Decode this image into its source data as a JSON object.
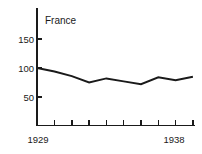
{
  "chart_data": {
    "type": "line",
    "title": "France",
    "xlabel": "",
    "ylabel": "",
    "x": [
      1929,
      1930,
      1931,
      1932,
      1933,
      1934,
      1935,
      1936,
      1937,
      1938
    ],
    "values": [
      100,
      94,
      86,
      75,
      82,
      77,
      72,
      84,
      79,
      85
    ],
    "series": [
      {
        "name": "France",
        "values": [
          100,
          94,
          86,
          75,
          82,
          77,
          72,
          84,
          79,
          85
        ]
      }
    ],
    "xlim": [
      1929,
      1938
    ],
    "ylim": [
      0,
      170
    ],
    "yticks": [
      50,
      100,
      150
    ],
    "ytick_labels": [
      "50",
      "100",
      "150"
    ],
    "xticks": [
      1929,
      1930,
      1931,
      1932,
      1933,
      1934,
      1935,
      1936,
      1937,
      1938
    ],
    "xtick_labels_shown": [
      "1929",
      "1938"
    ],
    "grid": false,
    "legend": false,
    "line_color": "#1a1a1a",
    "background_color": "#ffffff"
  },
  "axis": {
    "y_labels": [
      "150",
      "100",
      "50"
    ],
    "x_label_left": "1929",
    "x_label_right": "1938"
  },
  "title": {
    "text": "France"
  }
}
